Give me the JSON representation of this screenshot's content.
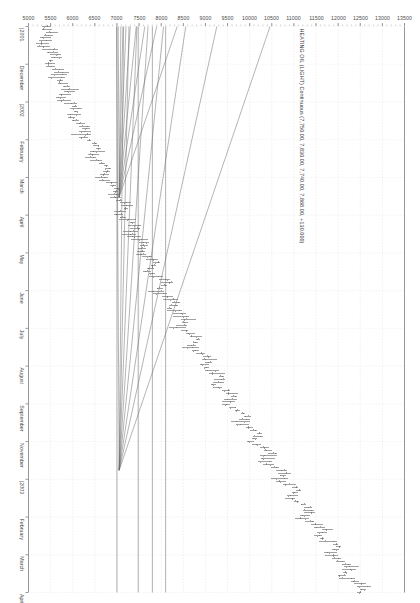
{
  "chart_data": {
    "type": "line",
    "title": "HEATING OIL (LIGHT) Continuous (7,750.00, 7,830.00, 7,740.00, 7,868.00, +130.000)",
    "subtitle": "",
    "xlabel": "",
    "ylabel": "",
    "orientation": "rotated-90-clockwise",
    "grid": true,
    "legend": "none",
    "price_axis": {
      "position": "top-rotated",
      "min": 5000,
      "max": 13500,
      "step": 500,
      "ticks": [
        13500,
        13000,
        12500,
        12000,
        11500,
        11000,
        10500,
        10000,
        9500,
        9000,
        8500,
        8000,
        7500,
        7000,
        6500,
        6000,
        5500,
        5000
      ],
      "tick_labels": [
        "13500",
        "13000",
        "12500",
        "12000",
        "11500",
        "11000",
        "10500",
        "10000",
        "9500",
        "9000",
        "8500",
        "8000",
        "7500",
        "7000",
        "6500",
        "6000",
        "5500",
        "5000"
      ],
      "minor_ticks_per_major": 5
    },
    "time_axis": {
      "position": "right-rotated",
      "direction": "newest-at-top",
      "tick_labels": [
        "April",
        "March",
        "February",
        "|2003",
        "November",
        "September",
        "August",
        "July",
        "June",
        "May",
        "April",
        "March",
        "February",
        "|2002",
        "December",
        "|2001"
      ],
      "year_markers": [
        "|2003",
        "|2002",
        "|2001"
      ],
      "span": "2001 - 2003"
    },
    "quote": {
      "open": "7,750.00",
      "high": "7,830.00",
      "low": "7,740.00",
      "close": "7,868.00",
      "change": "+130.000"
    },
    "series": [
      {
        "name": "HEATING OIL (LIGHT) Continuous",
        "style": "ohlc-bars",
        "color": "#555555",
        "values": [
          5380,
          5420,
          5510,
          5460,
          5390,
          5330,
          5280,
          5350,
          5470,
          5560,
          5620,
          5580,
          5510,
          5470,
          5530,
          5640,
          5710,
          5680,
          5620,
          5700,
          5790,
          5860,
          5930,
          5880,
          5810,
          5760,
          5840,
          5950,
          6040,
          6120,
          6080,
          6010,
          5960,
          6050,
          6180,
          6260,
          6320,
          6270,
          6190,
          6240,
          6350,
          6470,
          6540,
          6610,
          6550,
          6480,
          6420,
          6530,
          6660,
          6740,
          6810,
          6760,
          6680,
          6620,
          6710,
          6840,
          6930,
          7010,
          6960,
          6880,
          6940,
          7060,
          7150,
          7230,
          7180,
          7100,
          7040,
          7140,
          7270,
          7360,
          7430,
          7380,
          7300,
          7240,
          7350,
          7480,
          7570,
          7650,
          7600,
          7520,
          7580,
          7700,
          7800,
          7880,
          7830,
          7750,
          7690,
          7800,
          7930,
          8020,
          8090,
          8040,
          7960,
          7900,
          8010,
          8140,
          8240,
          8330,
          8280,
          8200,
          8260,
          8390,
          8490,
          8580,
          8530,
          8450,
          8390,
          8510,
          8650,
          8750,
          8830,
          8780,
          8700,
          8640,
          8760,
          8900,
          9010,
          9100,
          9050,
          8970,
          9030,
          9170,
          9280,
          9370,
          9320,
          9240,
          9180,
          9310,
          9450,
          9560,
          9640,
          9590,
          9510,
          9450,
          9580,
          9720,
          9840,
          9930,
          9880,
          9800,
          9870,
          10010,
          10130,
          10220,
          10170,
          10090,
          10030,
          10160,
          10310,
          10420,
          10500,
          10450,
          10370,
          10310,
          10440,
          10590,
          10710,
          10800,
          10750,
          10670,
          10740,
          10890,
          11010,
          11100,
          11050,
          10970,
          10910,
          11050,
          11200,
          11310,
          11390,
          11340,
          11260,
          11200,
          11340,
          11490,
          11610,
          11700,
          11650,
          11570,
          11640,
          11790,
          11910,
          12000,
          11950,
          11870,
          11810,
          11950,
          12100,
          12210,
          12290,
          12240,
          12160,
          12100,
          12240,
          12390,
          12510,
          12600,
          12550,
          12470
        ]
      }
    ],
    "trendlines": {
      "count": 18,
      "description": "Two Gann-style fans of straight trendlines radiating from two pivot points, plus several horizontal price-level lines.",
      "fan_pivots": [
        {
          "label": "pivot-upper",
          "price": 7050,
          "date_label": "|2003"
        },
        {
          "label": "pivot-lower",
          "price": 7050,
          "date_label": "|2002"
        }
      ],
      "horizontal_levels": [
        8100,
        7800,
        7480,
        7000
      ]
    }
  }
}
